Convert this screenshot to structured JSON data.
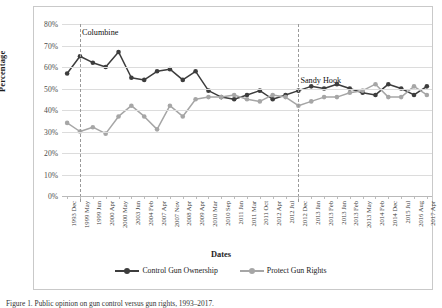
{
  "figure": {
    "caption": "Figure 1. Public opinion on gun control versus gun rights, 1993–2017."
  },
  "chart_data": {
    "type": "line",
    "title": "",
    "xlabel": "Dates",
    "ylabel": "Percentage",
    "ylim": [
      0,
      80
    ],
    "ytick_labels": [
      "80%",
      "70%",
      "60%",
      "50%",
      "40%",
      "30%",
      "20%",
      "10%",
      "0%"
    ],
    "ytick_values": [
      80,
      70,
      60,
      50,
      40,
      30,
      20,
      10,
      0
    ],
    "grid": "horizontal",
    "legend_position": "bottom",
    "categories": [
      "1993 Dec",
      "1999 May",
      "1999 Jun",
      "2000 Apr",
      "2000 May",
      "2003 Jun",
      "2004 Feb",
      "2007 Apr",
      "2007 Nov",
      "2008 Apr",
      "2009 Apr",
      "2010 Mar",
      "2010 Sep",
      "2011 Jan",
      "2011 Mar",
      "2011 Oct",
      "2012 Apr",
      "2012 Jul",
      "2012 Dec",
      "2013 Jan",
      "2013 Feb",
      "2013 Jan",
      "2013 Feb",
      "2013 May",
      "2014 Feb",
      "2014 Dec",
      "2015 Jul",
      "2016 Aug",
      "2017 Apr"
    ],
    "series": [
      {
        "name": "Control Gun Ownership",
        "color": "#3d3d3d",
        "values": [
          57,
          65,
          62,
          60,
          67,
          55,
          54,
          58,
          59,
          54,
          58,
          49,
          46,
          45,
          47,
          49,
          45,
          47,
          49,
          51,
          50,
          52,
          50,
          48,
          47,
          52,
          50,
          47,
          51
        ]
      },
      {
        "name": "Protect Gun Rights",
        "color": "#a6a6a6",
        "values": [
          34,
          30,
          32,
          29,
          37,
          42,
          37,
          31,
          42,
          37,
          45,
          46,
          46,
          47,
          45,
          44,
          47,
          46,
          42,
          44,
          46,
          46,
          48,
          49,
          52,
          46,
          46,
          51,
          47
        ]
      }
    ],
    "annotations": [
      {
        "label": "Columbine",
        "category_index": 1
      },
      {
        "label": "Sandy Hook",
        "category_index": 18
      }
    ]
  }
}
